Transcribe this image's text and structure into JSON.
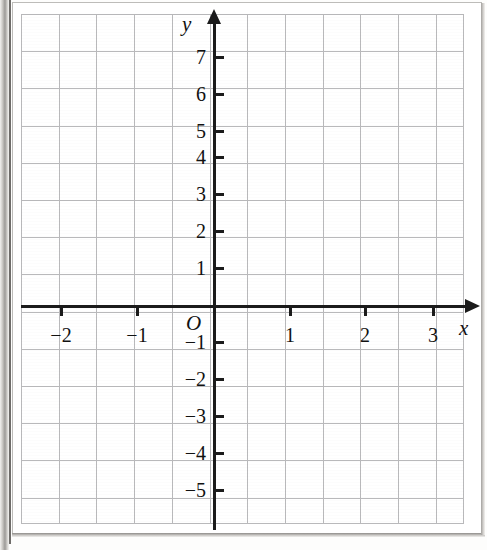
{
  "figure": {
    "kind": "cartesian-coordinate-grid",
    "background_color": "#ffffff",
    "grid_line_color": "#b9b9bb",
    "axis_color": "#1b1b1b"
  },
  "axes": {
    "x": {
      "name": "x",
      "arrow": true,
      "tick_labels": [
        "-2",
        "-1",
        "1",
        "2",
        "3"
      ],
      "tick_values": [
        -2,
        -1,
        1,
        2,
        3
      ],
      "range": [
        -2.6,
        3.5
      ]
    },
    "y": {
      "name": "y",
      "arrow": true,
      "tick_labels": [
        "7",
        "6",
        "5",
        "4",
        "3",
        "2",
        "1",
        "-1",
        "-2",
        "-3",
        "-4",
        "-5"
      ],
      "tick_values": [
        7,
        6,
        5,
        4,
        3,
        2,
        1,
        -1,
        -2,
        -3,
        -4,
        -5
      ],
      "range": [
        -5.8,
        7.8
      ]
    },
    "origin_label": "O"
  },
  "chart_data": {
    "type": "scatter",
    "title": "",
    "subtitle": "",
    "xlabel": "x",
    "ylabel": "y",
    "xlim": [
      -2.6,
      3.5
    ],
    "ylim": [
      -5.8,
      7.8
    ],
    "xticks": [
      -2,
      -1,
      1,
      2,
      3
    ],
    "xticklabels": [
      "-2",
      "-1",
      "1",
      "2",
      "3"
    ],
    "yticks": [
      7,
      6,
      5,
      4,
      3,
      2,
      1,
      -1,
      -2,
      -3,
      -4,
      -5
    ],
    "yticklabels": [
      "7",
      "6",
      "5",
      "4",
      "3",
      "2",
      "1",
      "-1",
      "-2",
      "-3",
      "-4",
      "-5"
    ],
    "grid": true,
    "grid_spacing": 1,
    "legend": null,
    "series": [],
    "annotations": [
      {
        "text": "O",
        "x": 0,
        "y": 0,
        "role": "origin-label"
      },
      {
        "text": "x",
        "x": 3.5,
        "y": 0,
        "role": "x-axis-name"
      },
      {
        "text": "y",
        "x": 0,
        "y": 7.8,
        "role": "y-axis-name"
      }
    ]
  },
  "ticks": {
    "y_items": [
      {
        "label": "7",
        "top": 57
      },
      {
        "label": "6",
        "top": 94
      },
      {
        "label": "5",
        "top": 131
      },
      {
        "label": "4",
        "top": 157
      },
      {
        "label": "3",
        "top": 194
      },
      {
        "label": "2",
        "top": 231
      },
      {
        "label": "1",
        "top": 268
      },
      {
        "label": "-1",
        "top": 342
      },
      {
        "label": "-2",
        "top": 379
      },
      {
        "label": "-3",
        "top": 416
      },
      {
        "label": "-4",
        "top": 453
      },
      {
        "label": "-5",
        "top": 490
      }
    ],
    "x_items": [
      {
        "label": "-2",
        "left": 61
      },
      {
        "label": "-1",
        "left": 137
      },
      {
        "label": "1",
        "left": 290
      },
      {
        "label": "2",
        "left": 365
      },
      {
        "label": "3",
        "left": 433
      }
    ]
  }
}
